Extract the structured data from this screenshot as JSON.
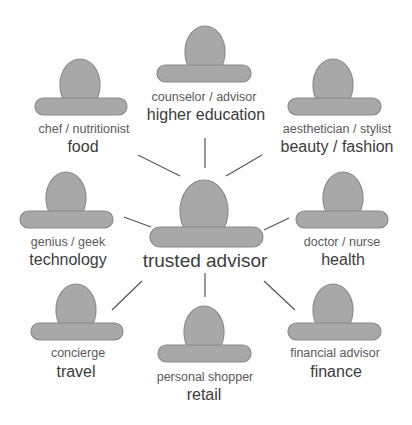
{
  "diagram": {
    "colors": {
      "figure_fill": "#a8a8a8",
      "figure_stroke": "#8a8a8a",
      "connector": "#555555",
      "role_text": "#5a5a5a",
      "domain_text": "#3c3c3c",
      "background": "#ffffff"
    },
    "center": {
      "label": "trusted advisor",
      "icon": "person-icon"
    },
    "nodes": [
      {
        "id": "higher-education",
        "role": "counselor / advisor",
        "domain": "higher education",
        "icon": "person-icon"
      },
      {
        "id": "food",
        "role": "chef / nutritionist",
        "domain": "food",
        "icon": "person-icon"
      },
      {
        "id": "beauty-fashion",
        "role": "aesthetician / stylist",
        "domain": "beauty / fashion",
        "icon": "person-icon"
      },
      {
        "id": "technology",
        "role": "genius / geek",
        "domain": "technology",
        "icon": "person-icon"
      },
      {
        "id": "health",
        "role": "doctor / nurse",
        "domain": "health",
        "icon": "person-icon"
      },
      {
        "id": "travel",
        "role": "concierge",
        "domain": "travel",
        "icon": "person-icon"
      },
      {
        "id": "retail",
        "role": "personal shopper",
        "domain": "retail",
        "icon": "person-icon"
      },
      {
        "id": "finance",
        "role": "financial advisor",
        "domain": "finance",
        "icon": "person-icon"
      }
    ]
  }
}
